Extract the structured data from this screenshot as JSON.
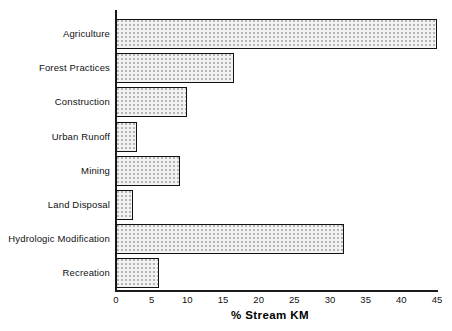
{
  "chart_data": {
    "type": "bar",
    "orientation": "horizontal",
    "title": "",
    "xlabel": "% Stream KM",
    "ylabel": "",
    "xlim": [
      0,
      45
    ],
    "xticks": [
      0,
      5,
      10,
      15,
      20,
      25,
      30,
      35,
      40,
      45
    ],
    "xtick_labels": [
      "0",
      "5",
      "10",
      "15",
      "20",
      "25",
      "30",
      "35",
      "40",
      "45"
    ],
    "grid": false,
    "legend": null,
    "categories": [
      "Agriculture",
      "Forest  Practices",
      "Construction",
      "Urban Runoff",
      "Mining",
      "Land Disposal",
      "Hydrologic  Modification",
      "Recreation"
    ],
    "values": [
      45,
      16.5,
      10,
      3,
      9,
      2.4,
      32,
      6
    ],
    "bar_style": {
      "fill": "#f2f2f2",
      "pattern": "dotted-stipple",
      "edge": "#111111"
    }
  },
  "axes": {
    "axis_color": "#1a1a1a"
  }
}
